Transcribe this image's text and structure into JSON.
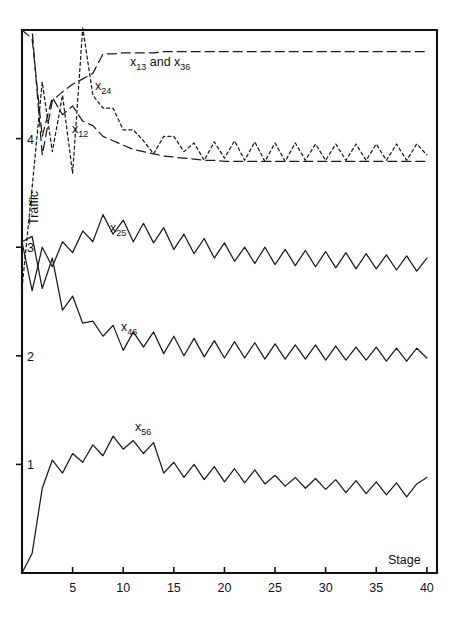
{
  "chart_data": {
    "type": "line",
    "title": "",
    "xlabel": "Stage",
    "ylabel": "Traffic",
    "xlim": [
      0,
      41
    ],
    "ylim": [
      0,
      5.0
    ],
    "grid": false,
    "legend_position": "inline-annotations",
    "x_ticks": [
      5,
      10,
      15,
      20,
      25,
      30,
      35,
      40
    ],
    "y_ticks": [
      1,
      2,
      3,
      4
    ],
    "x_tick_labels": [
      "5",
      "10",
      "15",
      "20",
      "25",
      "30",
      "35",
      "40"
    ],
    "y_tick_labels": [
      "1",
      "2",
      "3",
      "4"
    ],
    "x": [
      1,
      2,
      3,
      4,
      5,
      6,
      7,
      8,
      9,
      10,
      11,
      12,
      13,
      14,
      15,
      16,
      17,
      18,
      19,
      20,
      21,
      22,
      23,
      24,
      25,
      26,
      27,
      28,
      29,
      30,
      31,
      32,
      33,
      34,
      35,
      36,
      37,
      38,
      39,
      40
    ],
    "series": [
      {
        "name": "x13 and x36",
        "label": "x",
        "subscript": "13 and x",
        "subscript2": "36",
        "style": "dashed",
        "values": [
          5.0,
          3.85,
          4.35,
          4.43,
          4.5,
          4.55,
          4.6,
          4.78,
          4.78,
          4.79,
          4.79,
          4.79,
          4.79,
          4.8,
          4.8,
          4.8,
          4.8,
          4.8,
          4.8,
          4.8,
          4.8,
          4.8,
          4.8,
          4.8,
          4.8,
          4.8,
          4.8,
          4.8,
          4.8,
          4.8,
          4.8,
          4.8,
          4.8,
          4.8,
          4.8,
          4.8,
          4.8,
          4.8,
          4.8,
          4.8
        ]
      },
      {
        "name": "x24",
        "label": "x",
        "subscript": "24",
        "style": "dotted",
        "values": [
          3.55,
          4.52,
          3.88,
          4.4,
          3.68,
          5.02,
          4.4,
          4.28,
          4.28,
          4.08,
          4.08,
          3.98,
          3.86,
          4.02,
          4.02,
          3.88,
          3.96,
          3.8,
          3.97,
          3.82,
          3.98,
          3.8,
          3.97,
          3.79,
          3.96,
          3.79,
          3.96,
          3.8,
          3.95,
          3.8,
          3.95,
          3.8,
          3.95,
          3.8,
          3.95,
          3.8,
          3.95,
          3.8,
          3.95,
          3.85
        ]
      },
      {
        "name": "x12",
        "label": "x",
        "subscript": "12",
        "style": "dashed",
        "values": [
          4.92,
          4.02,
          4.38,
          4.22,
          4.3,
          4.16,
          4.12,
          4.02,
          3.98,
          3.94,
          3.9,
          3.88,
          3.86,
          3.84,
          3.83,
          3.82,
          3.81,
          3.8,
          3.8,
          3.79,
          3.79,
          3.79,
          3.79,
          3.79,
          3.79,
          3.79,
          3.79,
          3.79,
          3.79,
          3.79,
          3.79,
          3.79,
          3.79,
          3.79,
          3.79,
          3.79,
          3.79,
          3.79,
          3.79,
          3.79
        ]
      },
      {
        "name": "x25",
        "label": "x",
        "subscript": "25",
        "style": "solid",
        "values": [
          2.6,
          3.0,
          2.82,
          3.05,
          2.95,
          3.15,
          3.05,
          3.3,
          3.12,
          3.25,
          3.05,
          3.22,
          3.04,
          3.18,
          2.98,
          3.12,
          2.94,
          3.08,
          2.9,
          3.04,
          2.87,
          3.0,
          2.85,
          3.0,
          2.84,
          2.98,
          2.83,
          2.97,
          2.82,
          2.96,
          2.81,
          2.95,
          2.8,
          2.94,
          2.8,
          2.93,
          2.79,
          2.92,
          2.78,
          2.9
        ]
      },
      {
        "name": "x46",
        "label": "x",
        "subscript": "46",
        "style": "solid",
        "values": [
          3.1,
          2.62,
          2.9,
          2.42,
          2.55,
          2.3,
          2.32,
          2.18,
          2.28,
          2.05,
          2.22,
          2.08,
          2.22,
          2.02,
          2.18,
          2.0,
          2.16,
          1.99,
          2.14,
          1.98,
          2.13,
          1.98,
          2.12,
          1.97,
          2.11,
          1.97,
          2.1,
          1.97,
          2.1,
          1.96,
          2.09,
          1.96,
          2.08,
          1.96,
          2.08,
          1.95,
          2.07,
          1.95,
          2.07,
          1.98
        ]
      },
      {
        "name": "x56",
        "label": "x",
        "subscript": "56",
        "style": "solid",
        "values": [
          0.18,
          0.78,
          1.04,
          0.92,
          1.1,
          1.02,
          1.18,
          1.08,
          1.26,
          1.14,
          1.22,
          1.1,
          1.2,
          0.92,
          1.02,
          0.88,
          1.0,
          0.86,
          0.98,
          0.84,
          0.96,
          0.83,
          0.95,
          0.82,
          0.9,
          0.8,
          0.88,
          0.78,
          0.87,
          0.77,
          0.86,
          0.74,
          0.85,
          0.73,
          0.84,
          0.72,
          0.83,
          0.7,
          0.82,
          0.88
        ]
      }
    ],
    "annotations": [
      {
        "id": "ann-x13-x36",
        "text": "x13 and x36",
        "base": "x",
        "sub1": "13",
        "mid": " and ",
        "base2": "x",
        "sub2": "36",
        "x_px": 130,
        "y_px": 66
      },
      {
        "id": "ann-x24",
        "text": "x24",
        "base": "x",
        "sub1": "24",
        "x_px": 95,
        "y_px": 90
      },
      {
        "id": "ann-x12",
        "text": "x12",
        "base": "x",
        "sub1": "12",
        "x_px": 72,
        "y_px": 133
      },
      {
        "id": "ann-x25",
        "text": "x25",
        "base": "x",
        "sub1": "25",
        "x_px": 110,
        "y_px": 232
      },
      {
        "id": "ann-x46",
        "text": "x46",
        "base": "x",
        "sub1": "46",
        "x_px": 121,
        "y_px": 331
      },
      {
        "id": "ann-x56",
        "text": "x56",
        "base": "x",
        "sub1": "56",
        "x_px": 135,
        "y_px": 431
      }
    ],
    "colors": {
      "axis": "#111111",
      "series": "#1a1a1a",
      "background": "#ffffff"
    }
  }
}
